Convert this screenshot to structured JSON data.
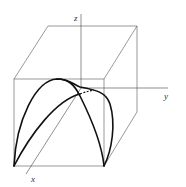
{
  "figure": {
    "axes": {
      "x_label": "x",
      "y_label": "y",
      "z_label": "z"
    },
    "colors": {
      "box": "#555555",
      "curves": "#111111",
      "axes": "#444444"
    }
  }
}
